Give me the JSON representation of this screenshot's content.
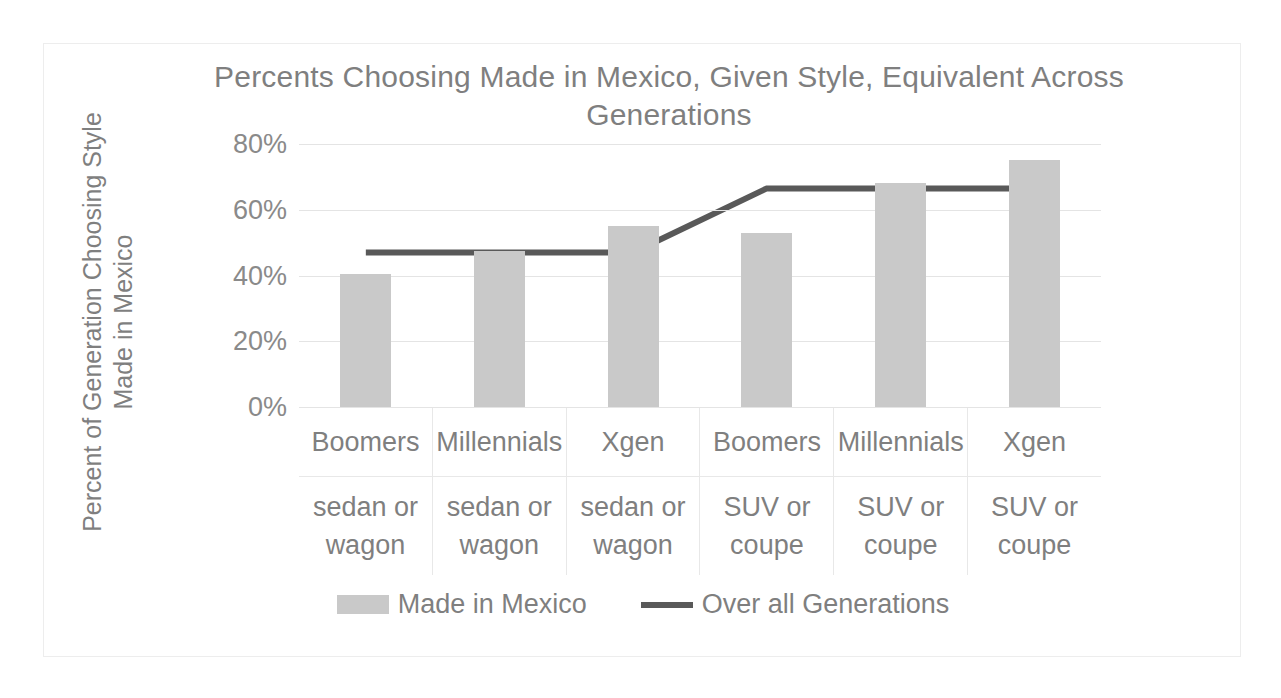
{
  "chart_data": {
    "type": "bar",
    "title": "Percents Choosing Made in Mexico, Given Style, Equivalent Across Generations",
    "xlabel": "",
    "ylabel": "Percent of Generation Choosing Style Made in Mexico",
    "ylim": [
      0,
      80
    ],
    "ytick_labels": [
      "80%",
      "60%",
      "40%",
      "20%",
      "0%"
    ],
    "ytick_values": [
      80,
      60,
      40,
      20,
      0
    ],
    "grid": true,
    "legend_position": "bottom",
    "categories": [
      {
        "generation": "Boomers",
        "style": "sedan or wagon"
      },
      {
        "generation": "Millennials",
        "style": "sedan or wagon"
      },
      {
        "generation": "Xgen",
        "style": "sedan or wagon"
      },
      {
        "generation": "Boomers",
        "style": "SUV or coupe"
      },
      {
        "generation": "Millennials",
        "style": "SUV or coupe"
      },
      {
        "generation": "Xgen",
        "style": "SUV or coupe"
      }
    ],
    "series": [
      {
        "name": "Made in Mexico",
        "type": "bar",
        "color": "#c9c9c9",
        "values": [
          40.5,
          47.5,
          55.0,
          53.0,
          68.0,
          75.0
        ]
      },
      {
        "name": "Over all Generations",
        "type": "line",
        "color": "#595959",
        "values": [
          47.0,
          47.0,
          47.0,
          66.5,
          66.5,
          66.5
        ]
      }
    ]
  },
  "legend": {
    "items": [
      {
        "label": "Made in Mexico",
        "marker": "bar-swatch"
      },
      {
        "label": "Over all Generations",
        "marker": "line-swatch"
      }
    ]
  },
  "colors": {
    "bar": "#c9c9c9",
    "line": "#595959",
    "text": "#7f7f7f",
    "gridline": "#e4e4e4",
    "frame_border": "#ededed"
  }
}
